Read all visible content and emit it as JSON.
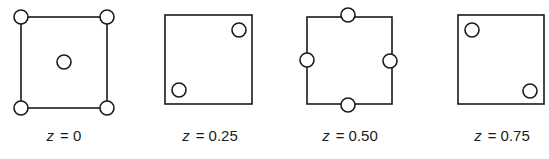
{
  "figure": {
    "panels": [
      {
        "label_var": "z",
        "label_value": "= 0",
        "square": {
          "x": 21,
          "y": 17,
          "w": 86,
          "h": 91
        },
        "atoms": [
          {
            "cx": 21,
            "cy": 17
          },
          {
            "cx": 107,
            "cy": 17
          },
          {
            "cx": 21,
            "cy": 108
          },
          {
            "cx": 107,
            "cy": 108
          },
          {
            "cx": 64,
            "cy": 62
          }
        ],
        "label_x": 64
      },
      {
        "label_var": "z",
        "label_value": "= 0.25",
        "square": {
          "x": 165,
          "y": 15,
          "w": 87,
          "h": 89
        },
        "atoms": [
          {
            "cx": 239,
            "cy": 30
          },
          {
            "cx": 179,
            "cy": 90
          }
        ],
        "label_x": 210
      },
      {
        "label_var": "z",
        "label_value": "= 0.50",
        "square": {
          "x": 307,
          "y": 17,
          "w": 85,
          "h": 87
        },
        "atoms": [
          {
            "cx": 348,
            "cy": 15
          },
          {
            "cx": 307,
            "cy": 60
          },
          {
            "cx": 390,
            "cy": 61
          },
          {
            "cx": 348,
            "cy": 105
          }
        ],
        "label_x": 350
      },
      {
        "label_var": "z",
        "label_value": "= 0.75",
        "square": {
          "x": 458,
          "y": 15,
          "w": 86,
          "h": 89
        },
        "atoms": [
          {
            "cx": 472,
            "cy": 30
          },
          {
            "cx": 530,
            "cy": 91
          }
        ],
        "label_x": 502
      }
    ],
    "atom_radius": 7,
    "stroke_color": "#1a1a1a",
    "fill_color": "#ffffff"
  }
}
